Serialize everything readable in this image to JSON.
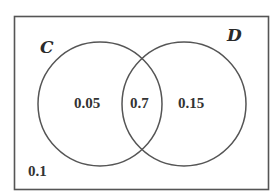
{
  "diagram": {
    "type": "venn",
    "universe": {
      "label": "",
      "outside_value": "0.1"
    },
    "sets": [
      {
        "name": "C",
        "only_value": "0.05"
      },
      {
        "name": "D",
        "only_value": "0.15"
      }
    ],
    "intersection": {
      "sets": [
        "C",
        "D"
      ],
      "value": "0.7"
    },
    "colors": {
      "stroke": "#555555",
      "text": "#2a2a2a",
      "background": "#ffffff"
    }
  }
}
